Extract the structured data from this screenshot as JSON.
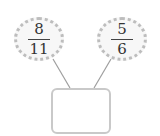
{
  "diagram": {
    "left_fraction": {
      "numerator": "8",
      "denominator": "11"
    },
    "right_fraction": {
      "numerator": "5",
      "denominator": "6"
    },
    "answer_box": {
      "value": ""
    },
    "colors": {
      "bubble_border": "#bdbdbd",
      "bubble_fill": "#f7f7f7",
      "line": "#9e9e9e",
      "box_border": "#c9c9c9"
    }
  }
}
